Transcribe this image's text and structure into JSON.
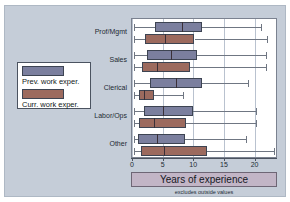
{
  "figure": {
    "background_color": "#c5cdd8",
    "plot_background_color": "#ffffff"
  },
  "legend": {
    "position": "left",
    "entries": [
      {
        "label": "Prev. work exper.",
        "color": "#7b7f9e",
        "icon": "color-swatch-icon"
      },
      {
        "label": "Curr. work exper.",
        "color": "#9c6a5e",
        "icon": "color-swatch-icon"
      }
    ]
  },
  "xaxis": {
    "title": "Years of experience",
    "note": "excludes outside values",
    "ticks": [
      "0",
      "5",
      "10",
      "15",
      "20"
    ],
    "tick_values": [
      0,
      5,
      10,
      15,
      20
    ],
    "min": 0,
    "max": 23.5
  },
  "chart_data": {
    "type": "box",
    "orientation": "horizontal",
    "title": "",
    "xlabel": "Years of experience",
    "ylabel": "",
    "xlim": [
      0,
      23.5
    ],
    "grid": true,
    "legend_position": "left",
    "annotations": [
      "excludes outside values"
    ],
    "categories": [
      "Prof/Mgmt",
      "Sales",
      "Clerical",
      "Labor/Ops",
      "Other"
    ],
    "series": [
      {
        "name": "Prev. work exper.",
        "color": "#7b7f9e",
        "boxes": [
          {
            "category": "Prof/Mgmt",
            "min": 0.3,
            "q1": 3.7,
            "median": 8.1,
            "q3": 11.5,
            "max": 21.0
          },
          {
            "category": "Sales",
            "min": 0.3,
            "q1": 2.4,
            "median": 6.4,
            "q3": 10.6,
            "max": 21.8
          },
          {
            "category": "Clerical",
            "min": 0.3,
            "q1": 3.0,
            "median": 7.1,
            "q3": 11.5,
            "max": 18.9
          },
          {
            "category": "Labor/Ops",
            "min": 0.3,
            "q1": 1.9,
            "median": 5.0,
            "q3": 10.0,
            "max": 20.3
          },
          {
            "category": "Other",
            "min": 0.3,
            "q1": 1.0,
            "median": 4.1,
            "q3": 8.6,
            "max": 18.6
          }
        ]
      },
      {
        "name": "Curr. work exper.",
        "color": "#9c6a5e",
        "boxes": [
          {
            "category": "Prof/Mgmt",
            "min": 0.3,
            "q1": 2.2,
            "median": 5.4,
            "q3": 10.2,
            "max": 22.0
          },
          {
            "category": "Sales",
            "min": 0.3,
            "q1": 1.6,
            "median": 4.1,
            "q3": 9.4,
            "max": 21.8
          },
          {
            "category": "Clerical",
            "min": 0.3,
            "q1": 1.1,
            "median": 1.9,
            "q3": 3.6,
            "max": 8.3
          },
          {
            "category": "Labor/Ops",
            "min": 0.3,
            "q1": 1.1,
            "median": 3.6,
            "q3": 8.8,
            "max": 20.2
          },
          {
            "category": "Other",
            "min": 0.3,
            "q1": 1.5,
            "median": 5.2,
            "q3": 12.2,
            "max": 23.2
          }
        ]
      }
    ]
  }
}
